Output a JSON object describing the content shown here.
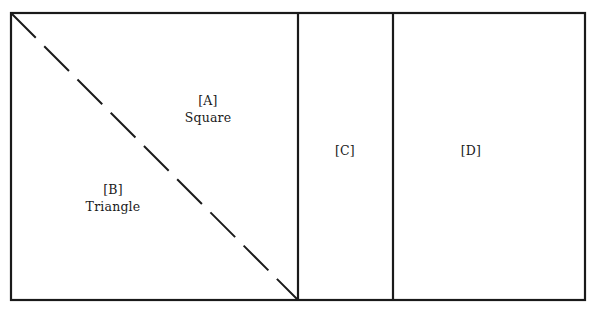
{
  "figure": {
    "background_color": "#ffffff",
    "stroke_color": "#1a1a1a",
    "frame": {
      "x1": 11,
      "y1": 13,
      "x2": 585,
      "y2": 300,
      "stroke_width": 2.2
    },
    "dividers": [
      {
        "name": "divider-panel1-panel-c",
        "x": 298,
        "stroke_width": 2.2
      },
      {
        "name": "divider-panel-c-panel-d",
        "x": 393,
        "stroke_width": 2.2
      }
    ],
    "diagonal": {
      "name": "diagonal-split-line",
      "x1": 11,
      "y1": 13,
      "x2": 298,
      "y2": 300,
      "style": "dashed",
      "dash_length": 35,
      "gap_length": 12,
      "stroke_width": 2.0
    }
  },
  "regions": {
    "a": {
      "tag": "[A]",
      "shape": "Square"
    },
    "b": {
      "tag": "[B]",
      "shape": "Triangle"
    },
    "c": {
      "tag": "[C]",
      "shape": ""
    },
    "d": {
      "tag": "[D]",
      "shape": ""
    }
  }
}
